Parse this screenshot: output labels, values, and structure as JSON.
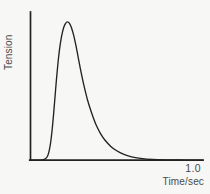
{
  "figure": {
    "name": "muscle-twitch-tension-curve",
    "background_color": "#f7f7f5",
    "ink_color": "#232323",
    "text_color": "#4a4a4a"
  },
  "chart_data": {
    "type": "line",
    "title": "",
    "subtitle": "",
    "xlabel": "Time/sec",
    "ylabel": "Tension",
    "xlim": [
      0,
      1.16
    ],
    "ylim": [
      0,
      1.12
    ],
    "grid": false,
    "legend": null,
    "xticks": [
      1.0
    ],
    "xticklabels": [
      "1.0"
    ],
    "yticks": [],
    "yticklabels": [],
    "annotations": [],
    "series": [
      {
        "name": "Twitch tension",
        "color": "#232323",
        "x": [
          0.0,
          0.04,
          0.08,
          0.1,
          0.115,
          0.125,
          0.135,
          0.145,
          0.155,
          0.165,
          0.175,
          0.185,
          0.195,
          0.205,
          0.215,
          0.225,
          0.235,
          0.245,
          0.255,
          0.265,
          0.275,
          0.29,
          0.305,
          0.32,
          0.34,
          0.36,
          0.385,
          0.41,
          0.44,
          0.47,
          0.5,
          0.54,
          0.58,
          0.62,
          0.68,
          0.74,
          0.82,
          0.92,
          1.04,
          1.16
        ],
        "y": [
          0.0,
          0.0,
          0.002,
          0.01,
          0.03,
          0.065,
          0.125,
          0.215,
          0.33,
          0.46,
          0.59,
          0.705,
          0.8,
          0.873,
          0.927,
          0.965,
          0.988,
          1.0,
          0.998,
          0.985,
          0.96,
          0.905,
          0.832,
          0.748,
          0.638,
          0.538,
          0.43,
          0.345,
          0.258,
          0.194,
          0.146,
          0.1,
          0.068,
          0.046,
          0.024,
          0.013,
          0.005,
          0.002,
          0.001,
          0.0
        ]
      }
    ]
  },
  "labels": {
    "y_axis": "Tension",
    "x_axis": "Time/sec",
    "x_tick_max": "1.0"
  }
}
